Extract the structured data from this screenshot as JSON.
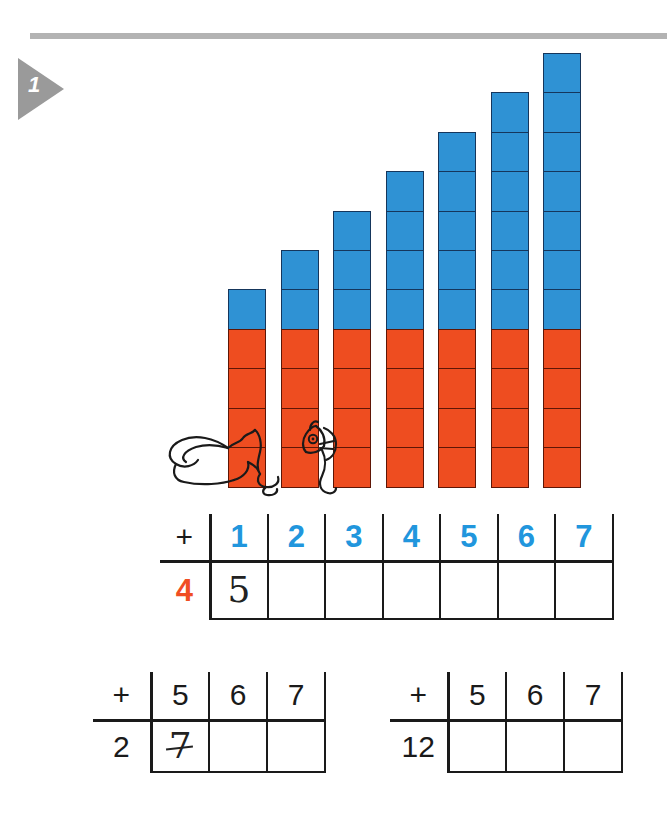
{
  "exercise": {
    "number": "1",
    "marker_color": "#9a9a9a"
  },
  "colors": {
    "blue": "#2f92d4",
    "red_orange": "#ee4d20",
    "header_blue": "#2196dd",
    "left_orange": "#f04e23",
    "rule_gray": "#b3b3b3"
  },
  "chart_data": {
    "type": "bar",
    "title": "",
    "xlabel": "",
    "ylabel": "",
    "categories": [
      "1",
      "2",
      "3",
      "4",
      "5",
      "6",
      "7"
    ],
    "unit": "cube",
    "stacked": true,
    "ylim": [
      0,
      11
    ],
    "grid": false,
    "legend_position": "none",
    "series": [
      {
        "name": "red (addend 4)",
        "color": "#ee4d20",
        "values": [
          4,
          4,
          4,
          4,
          4,
          4,
          4
        ]
      },
      {
        "name": "blue (addend 1-7)",
        "color": "#2f92d4",
        "values": [
          1,
          2,
          3,
          4,
          5,
          6,
          7
        ]
      }
    ],
    "totals": [
      5,
      6,
      7,
      8,
      9,
      10,
      11
    ],
    "annotations": [
      "hidden cat line drawing behind bars 1-3"
    ]
  },
  "decoration": {
    "cat_label": "cat-line-drawing"
  },
  "table_1": {
    "plus": "+",
    "headers": [
      "1",
      "2",
      "3",
      "4",
      "5",
      "6",
      "7"
    ],
    "left_operand": "4",
    "answers": [
      "5",
      "",
      "",
      "",
      "",
      "",
      ""
    ]
  },
  "table_2": {
    "plus": "+",
    "headers": [
      "5",
      "6",
      "7"
    ],
    "left_operand": "2",
    "answers": [
      "7",
      "",
      ""
    ]
  },
  "table_3": {
    "plus": "+",
    "headers": [
      "5",
      "6",
      "7"
    ],
    "left_operand": "12",
    "answers": [
      "",
      "",
      ""
    ]
  }
}
